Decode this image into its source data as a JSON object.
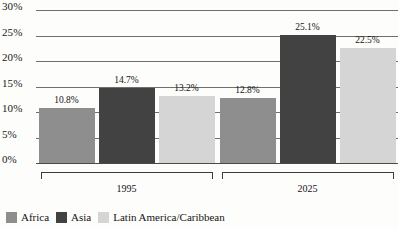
{
  "chart_data": {
    "type": "bar",
    "title": "",
    "subtitle": "",
    "xlabel": "",
    "ylabel": "",
    "ylim": [
      0,
      30
    ],
    "ytick_labels": [
      "0%",
      "5%",
      "10%",
      "15%",
      "20%",
      "25%",
      "30%"
    ],
    "ytick_values": [
      0,
      5,
      10,
      15,
      20,
      25,
      30
    ],
    "grid": true,
    "legend_position": "bottom-left",
    "categories": [
      "1995",
      "2025"
    ],
    "series": [
      {
        "name": "Africa",
        "color": "#8e8e8e",
        "values": [
          10.8,
          12.8
        ],
        "labels": [
          "10.8%",
          "12.8%"
        ]
      },
      {
        "name": "Asia",
        "color": "#424242",
        "values": [
          14.7,
          25.1
        ],
        "labels": [
          "14.7%",
          "25.1%"
        ]
      },
      {
        "name": "Latin America/Caribbean",
        "color": "#d5d5d5",
        "values": [
          13.2,
          22.5
        ],
        "labels": [
          "13.2%",
          "22.5%"
        ]
      }
    ],
    "group_brackets": [
      {
        "label": "1995"
      },
      {
        "label": "2025"
      }
    ]
  }
}
